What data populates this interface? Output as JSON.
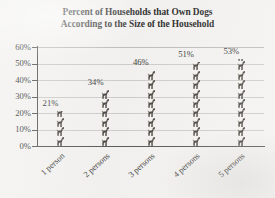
{
  "chart_data": {
    "type": "bar",
    "title": "Percent of Households that Own Dogs According to the Size of the Household",
    "title_lines": [
      "Percent of Households that Own Dogs",
      "According to the Size of the Household"
    ],
    "categories": [
      "1 person",
      "2 persons",
      "3 persons",
      "4 persons",
      "5 persons"
    ],
    "values": [
      21,
      34,
      46,
      51,
      53
    ],
    "value_labels": [
      "21%",
      "34%",
      "46%",
      "51%",
      "53%"
    ],
    "xlabel": "",
    "ylabel": "",
    "ylim": [
      0,
      60
    ],
    "y_tick_labels": [
      "60%",
      "50%",
      "40%",
      "30%",
      "20%",
      "10%",
      "0%"
    ],
    "y_tick_values": [
      60,
      50,
      40,
      30,
      20,
      10,
      0
    ],
    "grid": "horizontal",
    "legend": "none",
    "bar_style": "pictogram-dog-stack",
    "colors": {
      "background": "#f2f1ef",
      "text": "#1c1c1c",
      "gridline": "#c9c8c5",
      "axis": "#4a4a4a",
      "pictogram": "#3b362f"
    }
  }
}
